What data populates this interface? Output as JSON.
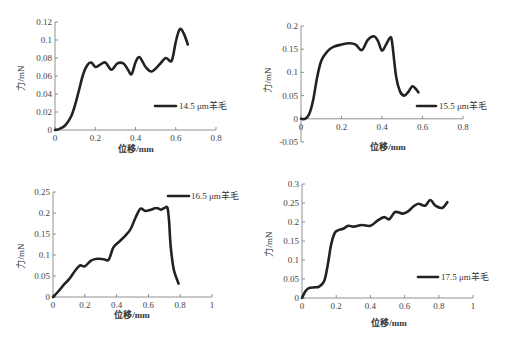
{
  "chart_data": [
    {
      "type": "line",
      "id": "tl",
      "title": "",
      "xlabel": "位移/mm",
      "ylabel": "力/mN",
      "xlim": [
        0,
        0.8
      ],
      "ylim": [
        0,
        0.12
      ],
      "xticks": [
        "0",
        "0.2",
        "0.4",
        "0.6",
        "0.8"
      ],
      "yticks": [
        "0",
        "0.02",
        "0.04",
        "0.06",
        "0.08",
        "0.1",
        "0.12"
      ],
      "legend_position": "right-middle",
      "series": [
        {
          "name": "14.5 μm羊毛",
          "x": [
            0,
            0.02,
            0.05,
            0.08,
            0.1,
            0.12,
            0.14,
            0.16,
            0.18,
            0.2,
            0.22,
            0.25,
            0.28,
            0.31,
            0.34,
            0.36,
            0.38,
            0.4,
            0.42,
            0.45,
            0.48,
            0.52,
            0.55,
            0.58,
            0.6,
            0.62,
            0.64,
            0.66
          ],
          "y": [
            0,
            0.001,
            0.005,
            0.015,
            0.028,
            0.045,
            0.062,
            0.072,
            0.075,
            0.07,
            0.072,
            0.075,
            0.067,
            0.074,
            0.074,
            0.068,
            0.062,
            0.075,
            0.081,
            0.07,
            0.065,
            0.073,
            0.08,
            0.077,
            0.098,
            0.112,
            0.107,
            0.095
          ]
        }
      ]
    },
    {
      "type": "line",
      "id": "tr",
      "title": "",
      "xlabel": "位移/mm",
      "ylabel": "力/mN",
      "xlim": [
        0,
        0.8
      ],
      "ylim": [
        -0.05,
        0.2
      ],
      "xticks": [
        "0",
        "0.2",
        "0.4",
        "0.6",
        "0.8"
      ],
      "yticks": [
        "-0.05",
        "0",
        "0.05",
        "0.1",
        "0.15",
        "0.2"
      ],
      "legend_position": "right-lower",
      "series": [
        {
          "name": "15.5 μm羊毛",
          "x": [
            0,
            0.02,
            0.04,
            0.06,
            0.08,
            0.1,
            0.13,
            0.16,
            0.2,
            0.24,
            0.27,
            0.3,
            0.33,
            0.36,
            0.38,
            0.4,
            0.42,
            0.44,
            0.45,
            0.47,
            0.49,
            0.51,
            0.53,
            0.55,
            0.57,
            0.58
          ],
          "y": [
            0,
            0,
            0.01,
            0.04,
            0.09,
            0.125,
            0.145,
            0.155,
            0.16,
            0.163,
            0.16,
            0.148,
            0.17,
            0.178,
            0.168,
            0.147,
            0.16,
            0.175,
            0.165,
            0.09,
            0.058,
            0.05,
            0.058,
            0.07,
            0.063,
            0.057
          ]
        }
      ]
    },
    {
      "type": "line",
      "id": "bl",
      "title": "",
      "xlabel": "位移/mm",
      "ylabel": "力/mN",
      "xlim": [
        0,
        1
      ],
      "ylim": [
        0,
        0.25
      ],
      "xticks": [
        "0",
        "0.2",
        "0.4",
        "0.6",
        "0.8",
        "1"
      ],
      "yticks": [
        "0",
        "0.05",
        "0.1",
        "0.15",
        "0.2",
        "0.25"
      ],
      "legend_position": "top-right",
      "series": [
        {
          "name": "16.5 μm羊毛",
          "x": [
            0,
            0.03,
            0.07,
            0.1,
            0.14,
            0.17,
            0.2,
            0.24,
            0.28,
            0.32,
            0.35,
            0.38,
            0.42,
            0.46,
            0.49,
            0.52,
            0.55,
            0.58,
            0.61,
            0.65,
            0.68,
            0.7,
            0.72,
            0.73,
            0.74,
            0.76,
            0.79
          ],
          "y": [
            0,
            0.012,
            0.03,
            0.042,
            0.063,
            0.075,
            0.073,
            0.087,
            0.091,
            0.09,
            0.089,
            0.118,
            0.133,
            0.148,
            0.163,
            0.19,
            0.21,
            0.205,
            0.207,
            0.212,
            0.208,
            0.212,
            0.212,
            0.18,
            0.12,
            0.065,
            0.032
          ]
        }
      ]
    },
    {
      "type": "line",
      "id": "br",
      "title": "",
      "xlabel": "位移/mm",
      "ylabel": "力/mN",
      "xlim": [
        0,
        1
      ],
      "ylim": [
        0,
        0.3
      ],
      "xticks": [
        "0",
        "0.2",
        "0.4",
        "0.6",
        "0.8",
        "1"
      ],
      "yticks": [
        "0",
        "0.05",
        "0.1",
        "0.15",
        "0.2",
        "0.25",
        "0.3"
      ],
      "legend_position": "right-lower",
      "series": [
        {
          "name": "17.5 μm羊毛",
          "x": [
            0,
            0.02,
            0.04,
            0.07,
            0.1,
            0.13,
            0.15,
            0.17,
            0.19,
            0.21,
            0.24,
            0.27,
            0.3,
            0.35,
            0.4,
            0.44,
            0.48,
            0.51,
            0.54,
            0.56,
            0.59,
            0.62,
            0.65,
            0.68,
            0.72,
            0.75,
            0.78,
            0.82,
            0.85
          ],
          "y": [
            0,
            0.018,
            0.026,
            0.028,
            0.03,
            0.045,
            0.085,
            0.14,
            0.17,
            0.178,
            0.182,
            0.19,
            0.188,
            0.192,
            0.19,
            0.203,
            0.213,
            0.207,
            0.225,
            0.226,
            0.222,
            0.228,
            0.24,
            0.248,
            0.243,
            0.258,
            0.243,
            0.237,
            0.252
          ]
        }
      ]
    }
  ],
  "charts": {
    "tl": {
      "legend": "14.5 μm羊毛",
      "xlabel": "位移/mm",
      "ylabel": "力/mN"
    },
    "tr": {
      "legend": "15.5 μm羊毛",
      "xlabel": "位移/mm",
      "ylabel": "力/mN"
    },
    "bl": {
      "legend": "16.5 μm羊毛",
      "xlabel": "位移/mm",
      "ylabel": "力/mN"
    },
    "br": {
      "legend": "17.5 μm羊毛",
      "xlabel": "位移/mm",
      "ylabel": "力/mN"
    }
  }
}
